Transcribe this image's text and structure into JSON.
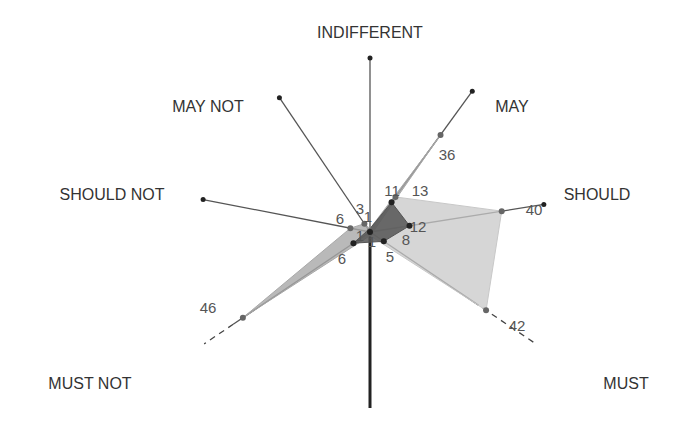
{
  "chart_data": {
    "type": "radar",
    "title": "",
    "axes": [
      {
        "name": "INDIFFERENT",
        "angle_deg": 90,
        "style": "solid"
      },
      {
        "name": "MAY",
        "angle_deg": 54,
        "style": "solid"
      },
      {
        "name": "SHOULD",
        "angle_deg": 9,
        "style": "solid"
      },
      {
        "name": "MUST",
        "angle_deg": -34,
        "style": "dashed-outer"
      },
      {
        "name": "",
        "angle_deg": -90,
        "style": "thick"
      },
      {
        "name": "MUST NOT",
        "angle_deg": -146,
        "style": "dashed-outer"
      },
      {
        "name": "SHOULD NOT",
        "angle_deg": 169,
        "style": "solid"
      },
      {
        "name": "MAY NOT",
        "angle_deg": 124,
        "style": "solid"
      }
    ],
    "axis_max": 60,
    "series": [
      {
        "name": "series-light",
        "color": "#c8c8c8",
        "opacity": 0.75,
        "points": [
          {
            "axis": "INDIFFERENT",
            "value": 1
          },
          {
            "axis": "MAY",
            "value": 13
          },
          {
            "axis": "SHOULD",
            "value": 40
          },
          {
            "axis": "MUST",
            "value": 42
          },
          {
            "axis": "MUST NOT",
            "value": 1
          },
          {
            "axis": "SHOULD NOT",
            "value": 1
          },
          {
            "axis": "MAY NOT",
            "value": 1
          }
        ],
        "labels": [
          {
            "axis": "SHOULD",
            "text": "40"
          },
          {
            "axis": "MUST",
            "text": "42"
          }
        ]
      },
      {
        "name": "series-mid",
        "color": "#a8a8a8",
        "opacity": 0.8,
        "points": [
          {
            "axis": "INDIFFERENT",
            "value": 1
          },
          {
            "axis": "MAY",
            "value": 36
          },
          {
            "axis": "SHOULD",
            "value": 1
          },
          {
            "axis": "MUST",
            "value": 1
          },
          {
            "axis": "MUST NOT",
            "value": 46
          },
          {
            "axis": "SHOULD NOT",
            "value": 6
          },
          {
            "axis": "MAY NOT",
            "value": 3
          }
        ],
        "labels": [
          {
            "axis": "MAY",
            "text": "36"
          },
          {
            "axis": "MUST NOT",
            "text": "46"
          },
          {
            "axis": "SHOULD NOT",
            "text": "6"
          },
          {
            "axis": "MAY NOT",
            "text": "3"
          }
        ]
      },
      {
        "name": "series-dark",
        "color": "#555555",
        "opacity": 0.85,
        "points": [
          {
            "axis": "INDIFFERENT",
            "value": 1
          },
          {
            "axis": "MAY",
            "value": 11
          },
          {
            "axis": "SHOULD",
            "value": 12
          },
          {
            "axis": "MUST",
            "value": 5
          },
          {
            "axis": "MUST NOT",
            "value": 6
          },
          {
            "axis": "SHOULD NOT",
            "value": 1
          },
          {
            "axis": "MAY NOT",
            "value": 1
          }
        ],
        "labels": [
          {
            "axis": "MAY",
            "text": "11"
          },
          {
            "axis": "SHOULD",
            "text": "12"
          },
          {
            "axis": "MUST",
            "text": "5"
          },
          {
            "axis": "MUST NOT",
            "text": "6"
          }
        ]
      }
    ],
    "extra_labels": [
      {
        "text": "13",
        "near": "MAY"
      },
      {
        "text": "8",
        "near": "SHOULD"
      },
      {
        "text": "1",
        "near": "center-left"
      },
      {
        "text": "1",
        "near": "center-below"
      },
      {
        "text": "1",
        "near": "center-up"
      }
    ],
    "legend": "none",
    "grid": false
  }
}
